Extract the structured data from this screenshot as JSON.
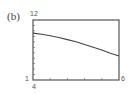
{
  "panel_label": "(b)",
  "chart_data": {
    "type": "line",
    "title": "",
    "xlabel": "",
    "ylabel": "",
    "xlim": [
      4,
      6
    ],
    "ylim": [
      1,
      12
    ],
    "x_tick_labels": [
      "4",
      "6"
    ],
    "y_tick_labels": [
      "1",
      "12"
    ],
    "grid": false,
    "x_ticks_count": 5,
    "y_ticks_count": 11,
    "series": [
      {
        "name": "curve",
        "x": [
          4.0,
          4.2,
          4.4,
          4.6,
          4.8,
          5.0,
          5.2,
          5.4,
          5.6,
          5.8,
          6.0
        ],
        "y": [
          9.6,
          9.4,
          9.1,
          8.8,
          8.4,
          8.0,
          7.5,
          7.0,
          6.5,
          5.9,
          5.4
        ]
      }
    ]
  },
  "labels": {
    "ymax": "12",
    "ymin": "1",
    "xmin": "4",
    "xmax": "6"
  },
  "colors": {
    "frame": "#555555",
    "curve": "#444444",
    "ticks": "#999999"
  }
}
